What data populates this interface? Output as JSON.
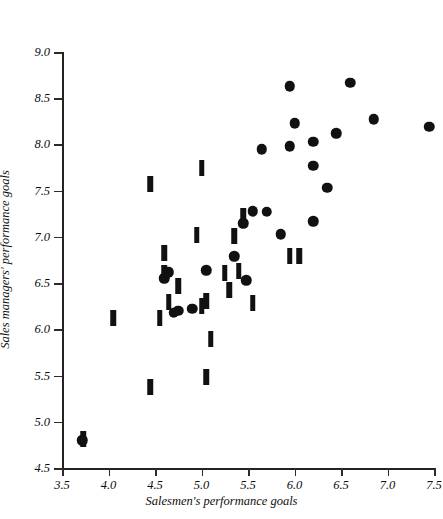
{
  "figure": {
    "top_bleed_text": "·   ·   ·   ·   ·   ·"
  },
  "chart_data": {
    "type": "scatter",
    "title": "",
    "xlabel": "Salesmen's performance goals",
    "ylabel": "Sales managers' performance goals",
    "xlim": [
      3.5,
      7.5
    ],
    "ylim": [
      4.5,
      9.0
    ],
    "xticks": [
      3.5,
      4.0,
      4.5,
      5.0,
      5.5,
      6.0,
      6.5,
      7.0,
      7.5
    ],
    "xticklabels": [
      "3.5",
      "4.0",
      "4.5",
      "5.0",
      "5.5",
      "6.0",
      "6.5",
      "7.0",
      "7.5"
    ],
    "yticks": [
      4.5,
      5.0,
      5.5,
      6.0,
      6.5,
      7.0,
      7.5,
      8.0,
      8.5,
      9.0
    ],
    "yticklabels": [
      "4.5",
      "5.0",
      "5.5",
      "6.0",
      "6.5",
      "7.0",
      "7.5",
      "8.0",
      "8.5",
      "9.0"
    ],
    "grid": false,
    "legend": "none",
    "marker_color": "#111111",
    "axis_color": "#232323",
    "series": [
      {
        "name": "circle-markers",
        "marker": "filled-circle",
        "points": [
          [
            5.95,
            8.63
          ],
          [
            6.6,
            8.67
          ],
          [
            6.0,
            8.23
          ],
          [
            6.45,
            8.12
          ],
          [
            6.85,
            8.27
          ],
          [
            7.45,
            8.19
          ],
          [
            6.2,
            8.03
          ],
          [
            5.65,
            7.95
          ],
          [
            5.95,
            7.98
          ],
          [
            6.2,
            7.77
          ],
          [
            6.35,
            7.53
          ],
          [
            5.55,
            7.28
          ],
          [
            5.7,
            7.27
          ],
          [
            6.2,
            7.17
          ],
          [
            5.45,
            7.15
          ],
          [
            5.85,
            7.03
          ],
          [
            5.35,
            6.79
          ],
          [
            5.05,
            6.64
          ],
          [
            4.65,
            6.62
          ],
          [
            4.6,
            6.55
          ],
          [
            5.48,
            6.53
          ],
          [
            4.75,
            6.2
          ],
          [
            4.7,
            6.18
          ],
          [
            4.9,
            6.22
          ],
          [
            3.72,
            4.8
          ]
        ]
      },
      {
        "name": "bar-markers",
        "marker": "vertical-bar",
        "points": [
          [
            5.0,
            7.74
          ],
          [
            4.45,
            7.57
          ],
          [
            5.45,
            7.23
          ],
          [
            4.95,
            7.02
          ],
          [
            5.35,
            7.01
          ],
          [
            5.95,
            6.79
          ],
          [
            6.05,
            6.79
          ],
          [
            4.6,
            6.83
          ],
          [
            4.6,
            6.61
          ],
          [
            5.4,
            6.63
          ],
          [
            5.25,
            6.61
          ],
          [
            4.75,
            6.47
          ],
          [
            5.3,
            6.43
          ],
          [
            5.05,
            6.31
          ],
          [
            4.65,
            6.3
          ],
          [
            5.55,
            6.28
          ],
          [
            5.0,
            6.25
          ],
          [
            4.55,
            6.12
          ],
          [
            4.05,
            6.12
          ],
          [
            5.1,
            5.9
          ],
          [
            5.05,
            5.48
          ],
          [
            4.45,
            5.38
          ],
          [
            3.73,
            4.81
          ]
        ]
      }
    ]
  }
}
